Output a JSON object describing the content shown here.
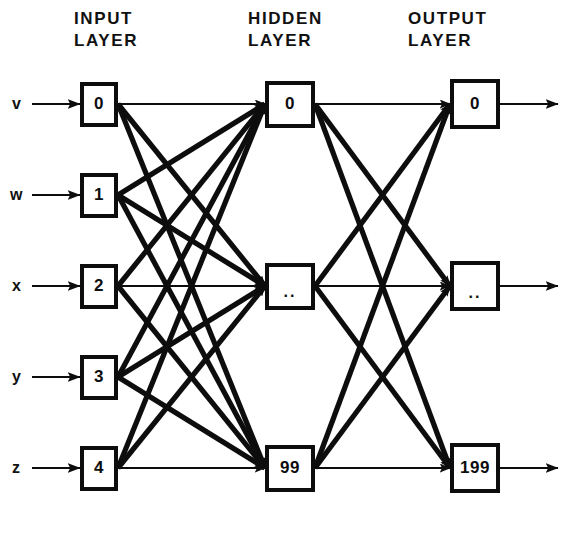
{
  "diagram": {
    "background_color": "#ffffff",
    "ink_color": "#0d0d0d",
    "headers": [
      {
        "name": "input",
        "text": "INPUT\nLAYER",
        "x": 74,
        "y": 8
      },
      {
        "name": "hidden",
        "text": "HIDDEN\nLAYER",
        "x": 248,
        "y": 8
      },
      {
        "name": "output",
        "text": "OUTPUT\nLAYER",
        "x": 408,
        "y": 8
      }
    ],
    "rows_y": [
      104,
      195,
      286,
      377,
      468
    ],
    "columns": {
      "input_x": 99,
      "hidden_x": 290,
      "output_x": 475
    },
    "input_layer": {
      "label": "INPUT LAYER",
      "box_width": 38,
      "box_height": 45,
      "nodes": [
        {
          "id": "in-0",
          "value": "0",
          "row": 0,
          "signal": "v"
        },
        {
          "id": "in-1",
          "value": "1",
          "row": 1,
          "signal": "w"
        },
        {
          "id": "in-2",
          "value": "2",
          "row": 2,
          "signal": "x"
        },
        {
          "id": "in-3",
          "value": "3",
          "row": 3,
          "signal": "y"
        },
        {
          "id": "in-4",
          "value": "4",
          "row": 4,
          "signal": "z"
        }
      ]
    },
    "hidden_layer": {
      "label": "HIDDEN LAYER",
      "box_width": 50,
      "box_height": 47,
      "nodes": [
        {
          "id": "hid-0",
          "value": "0",
          "row": 0
        },
        {
          "id": "hid-mid",
          "value": "..",
          "row": 2
        },
        {
          "id": "hid-99",
          "value": "99",
          "row": 4
        }
      ]
    },
    "output_layer": {
      "label": "OUTPUT LAYER",
      "box_width": 50,
      "box_height": 50,
      "nodes": [
        {
          "id": "out-0",
          "value": "0",
          "row": 0
        },
        {
          "id": "out-mid",
          "value": "..",
          "row": 2
        },
        {
          "id": "out-199",
          "value": "199",
          "row": 4
        }
      ]
    },
    "signal_labels": [
      {
        "text": "v",
        "x": 12,
        "y": 95
      },
      {
        "text": "w",
        "x": 10,
        "y": 186
      },
      {
        "text": "x",
        "x": 12,
        "y": 277
      },
      {
        "text": "y",
        "x": 12,
        "y": 368
      },
      {
        "text": "z",
        "x": 12,
        "y": 459
      }
    ],
    "connectivity": {
      "input_to_hidden": "fully-connected",
      "hidden_to_output": "fully-connected",
      "input_to_hidden_edges": 15,
      "hidden_to_output_edges": 9
    }
  }
}
